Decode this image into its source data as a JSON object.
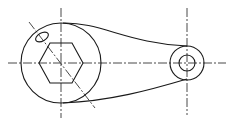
{
  "diagram": {
    "type": "mechanical-drawing",
    "colors": {
      "stroke": "#1a1a1a",
      "background": "#ffffff"
    },
    "elements": {
      "large_boss": {
        "cx": 61,
        "cy": 63,
        "r": 40
      },
      "hexagon": {
        "cx": 61,
        "cy": 63,
        "points": "39,63 50,43 72,43 83,63 72,83 50,83"
      },
      "small_boss_outer": {
        "cx": 187,
        "cy": 63,
        "r": 17
      },
      "small_boss_inner": {
        "cx": 187,
        "cy": 63,
        "r": 8
      },
      "slot_ellipse": {
        "cx": 42,
        "cy": 37,
        "rx": 7,
        "ry": 4,
        "rotate": -30
      },
      "upper_arm_curve": "M63,23 C100,22 130,44 187,46",
      "lower_arm_curve": "M63,103 C110,101 150,90 187,79",
      "centerlines": [
        {
          "name": "horizontal-axis",
          "x1": 8,
          "y1": 63,
          "x2": 226,
          "y2": 63
        },
        {
          "name": "vertical-axis-large",
          "x1": 61,
          "y1": 8,
          "x2": 61,
          "y2": 118
        },
        {
          "name": "vertical-axis-small",
          "x1": 187,
          "y1": 8,
          "x2": 187,
          "y2": 115
        },
        {
          "name": "diagonal-axis",
          "x1": 29,
          "y1": 22,
          "x2": 95,
          "y2": 108
        }
      ]
    }
  }
}
